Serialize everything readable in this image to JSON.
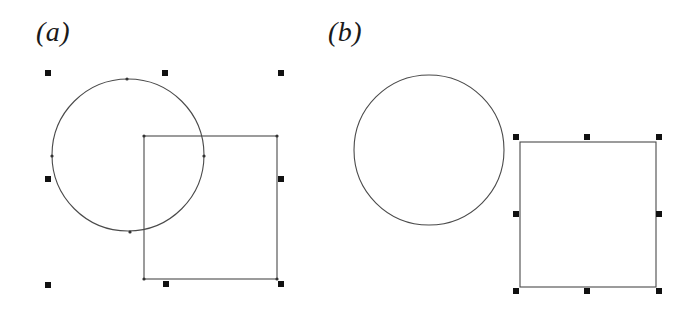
{
  "figure": {
    "panels": [
      {
        "id": "a",
        "label": "(a)",
        "description": "Circle and rectangle overlapping; both shapes selected together as a group with a shared bounding box",
        "circle": {
          "cx": 128,
          "cy": 155,
          "r": 76,
          "nodes": [
            [
              127,
              79
            ],
            [
              52,
              156
            ],
            [
              204,
              156
            ],
            [
              130,
              232
            ]
          ]
        },
        "rectangle": {
          "x": 144,
          "y": 136,
          "width": 133,
          "height": 143,
          "corner_nodes": [
            [
              144,
              136
            ],
            [
              277,
              136
            ],
            [
              144,
              279
            ],
            [
              277,
              279
            ]
          ]
        },
        "selection_handles": [
          [
            48,
            73
          ],
          [
            165,
            73
          ],
          [
            281,
            73
          ],
          [
            48,
            179
          ],
          [
            281,
            179
          ],
          [
            48,
            285
          ],
          [
            166,
            284
          ],
          [
            281,
            284
          ]
        ]
      },
      {
        "id": "b",
        "label": "(b)",
        "description": "Circle and rectangle separated; only the rectangle is selected with eight resize handles",
        "circle": {
          "cx": 429,
          "cy": 150,
          "r": 75
        },
        "rectangle": {
          "x": 520,
          "y": 142,
          "width": 136,
          "height": 145
        },
        "selection_handles": [
          [
            516,
            137
          ],
          [
            587,
            137
          ],
          [
            659,
            137
          ],
          [
            516,
            214
          ],
          [
            659,
            214
          ],
          [
            516,
            291
          ],
          [
            587,
            291
          ],
          [
            659,
            291
          ]
        ]
      }
    ],
    "colors": {
      "stroke": "#4a4a4a",
      "handle": "#111111",
      "background": "#ffffff"
    }
  }
}
